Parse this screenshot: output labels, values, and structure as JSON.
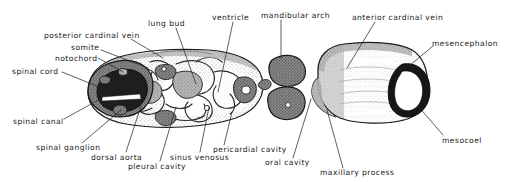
{
  "figure": {
    "kind": "anatomical-illustration",
    "background_color": "#ffffff",
    "ink_color": "#1a1a1a",
    "width": 509,
    "height": 182
  },
  "labels": [
    {
      "id": "posterior-cardinal-vein",
      "text": "posterior cardinal vein",
      "x": 44,
      "y": 32,
      "align": "left",
      "leader": [
        [
          131,
          39
        ],
        [
          163,
          58
        ]
      ]
    },
    {
      "id": "somite",
      "text": "somite",
      "x": 71,
      "y": 44,
      "align": "left",
      "leader": [
        [
          101,
          50
        ],
        [
          148,
          68
        ]
      ]
    },
    {
      "id": "notochord",
      "text": "notochord",
      "x": 55,
      "y": 55,
      "align": "left",
      "leader": [
        [
          98,
          58
        ],
        [
          123,
          72
        ]
      ]
    },
    {
      "id": "spinal-cord",
      "text": "spinal cord",
      "x": 12,
      "y": 68,
      "align": "left",
      "leader": [
        [
          62,
          72
        ],
        [
          104,
          89
        ]
      ]
    },
    {
      "id": "lung-bud",
      "text": "lung bud",
      "x": 148,
      "y": 20,
      "align": "left",
      "leader": [
        [
          176,
          28
        ],
        [
          196,
          84
        ]
      ]
    },
    {
      "id": "ventricle",
      "text": "ventricle",
      "x": 212,
      "y": 14,
      "align": "left",
      "leader": [
        [
          233,
          22
        ],
        [
          218,
          92
        ]
      ]
    },
    {
      "id": "mandibular-arch",
      "text": "mandibular arch",
      "x": 261,
      "y": 12,
      "align": "left",
      "leader": [
        [
          281,
          20
        ],
        [
          281,
          58
        ]
      ]
    },
    {
      "id": "anterior-cardinal-vein",
      "text": "anterior cardinal vein",
      "x": 352,
      "y": 14,
      "align": "left",
      "leader": [
        [
          375,
          22
        ],
        [
          347,
          68
        ]
      ]
    },
    {
      "id": "mesencephalon",
      "text": "mesencephalon",
      "x": 432,
      "y": 40,
      "align": "left",
      "leader": [
        [
          433,
          46
        ],
        [
          409,
          66
        ]
      ]
    },
    {
      "id": "mesocoel",
      "text": "mesocoel",
      "x": 442,
      "y": 137,
      "align": "left",
      "leader": [
        [
          443,
          135
        ],
        [
          418,
          106
        ]
      ]
    },
    {
      "id": "maxillary-process",
      "text": "maxillary process",
      "x": 320,
      "y": 169,
      "align": "left",
      "leader": [
        [
          343,
          168
        ],
        [
          327,
          110
        ]
      ]
    },
    {
      "id": "oral-cavity",
      "text": "oral cavity",
      "x": 265,
      "y": 159,
      "align": "left",
      "leader": [
        [
          293,
          158
        ],
        [
          311,
          99
        ]
      ]
    },
    {
      "id": "pericardial-cavity",
      "text": "pericardial cavity",
      "x": 213,
      "y": 146,
      "align": "left",
      "leader": [
        [
          224,
          145
        ],
        [
          232,
          112
        ]
      ]
    },
    {
      "id": "sinus-venosus",
      "text": "sinus venosus",
      "x": 170,
      "y": 154,
      "align": "left",
      "leader": [
        [
          200,
          152
        ],
        [
          209,
          107
        ]
      ]
    },
    {
      "id": "pleural-cavity",
      "text": "pleural cavity",
      "x": 128,
      "y": 163,
      "align": "left",
      "leader": [
        [
          160,
          161
        ],
        [
          176,
          107
        ]
      ]
    },
    {
      "id": "dorsal-aorta",
      "text": "dorsal aorta",
      "x": 91,
      "y": 154,
      "align": "left",
      "leader": [
        [
          126,
          152
        ],
        [
          141,
          106
        ]
      ]
    },
    {
      "id": "spinal-ganglion",
      "text": "spinal ganglion",
      "x": 36,
      "y": 144,
      "align": "left",
      "leader": [
        [
          82,
          143
        ],
        [
          121,
          110
        ]
      ]
    },
    {
      "id": "spinal-canal",
      "text": "spinal canal",
      "x": 13,
      "y": 118,
      "align": "left",
      "leader": [
        [
          64,
          119
        ],
        [
          102,
          98
        ]
      ]
    }
  ]
}
